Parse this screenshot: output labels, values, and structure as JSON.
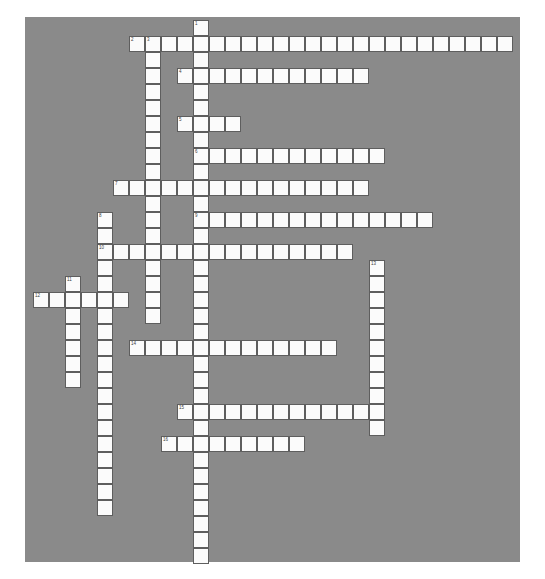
{
  "page": {
    "background_color": "#ffffff",
    "board_color": "#8a8a8a",
    "cell_color": "#fbfbfb",
    "cell_border_color": "#5e5e5e",
    "number_color": "#3c3c3c"
  },
  "board": {
    "left": 25,
    "top": 17,
    "width": 495,
    "height": 545,
    "cell_size": 16,
    "origin_x": 8,
    "origin_y": 3,
    "columns": 30,
    "rows": 34
  },
  "crossword": {
    "type": "crossword-grid",
    "numbers": [
      "1",
      "2",
      "3",
      "4",
      "5",
      "6",
      "7",
      "8",
      "9",
      "10",
      "11",
      "12",
      "13",
      "14",
      "15",
      "16"
    ],
    "entries": [
      {
        "number": "1",
        "direction": "down",
        "col": 10,
        "row": 0,
        "length": 34
      },
      {
        "number": "2",
        "direction": "across",
        "col": 6,
        "row": 1,
        "length": 24
      },
      {
        "number": "3",
        "direction": "down",
        "col": 7,
        "row": 1,
        "length": 18
      },
      {
        "number": "4",
        "direction": "across",
        "col": 9,
        "row": 3,
        "length": 12
      },
      {
        "number": "5",
        "direction": "across",
        "col": 9,
        "row": 6,
        "length": 4
      },
      {
        "number": "6",
        "direction": "across",
        "col": 10,
        "row": 8,
        "length": 12
      },
      {
        "number": "7",
        "direction": "across",
        "col": 5,
        "row": 10,
        "length": 16
      },
      {
        "number": "8",
        "direction": "down",
        "col": 4,
        "row": 12,
        "length": 19
      },
      {
        "number": "9",
        "direction": "across",
        "col": 10,
        "row": 12,
        "length": 15
      },
      {
        "number": "10",
        "direction": "across",
        "col": 4,
        "row": 14,
        "length": 16
      },
      {
        "number": "11",
        "direction": "down",
        "col": 2,
        "row": 16,
        "length": 7
      },
      {
        "number": "12",
        "direction": "across",
        "col": 0,
        "row": 17,
        "length": 6
      },
      {
        "number": "13",
        "direction": "down",
        "col": 21,
        "row": 15,
        "length": 11
      },
      {
        "number": "14",
        "direction": "across",
        "col": 6,
        "row": 20,
        "length": 13
      },
      {
        "number": "15",
        "direction": "across",
        "col": 9,
        "row": 24,
        "length": 13
      },
      {
        "number": "16",
        "direction": "across",
        "col": 8,
        "row": 26,
        "length": 9
      }
    ]
  }
}
